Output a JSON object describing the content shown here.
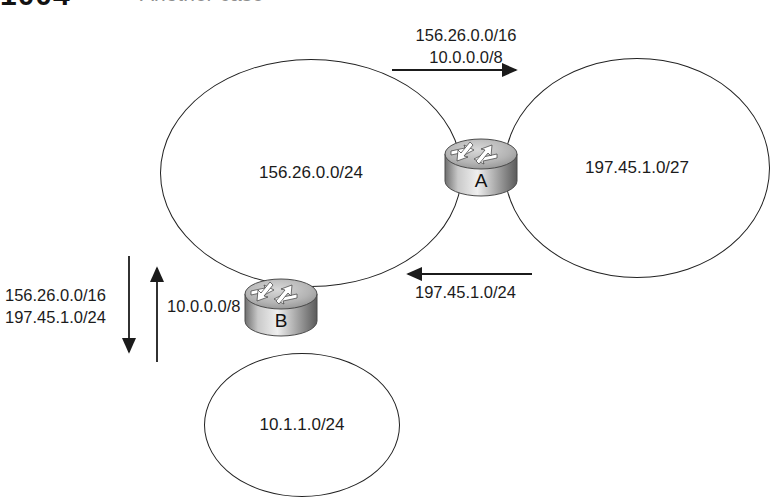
{
  "figure": {
    "number": "1004",
    "caption": "Another case"
  },
  "networks": {
    "left": {
      "label": "156.26.0.0/24"
    },
    "right": {
      "label": "197.45.1.0/27"
    },
    "bottom": {
      "label": "10.1.1.0/24"
    }
  },
  "routers": {
    "a": {
      "letter": "A",
      "icon": "router-icon"
    },
    "b": {
      "letter": "B",
      "icon": "router-icon"
    }
  },
  "advertisements": {
    "top": {
      "routes": "156.26.0.0/16\n10.0.0.0/8",
      "route_1": "156.26.0.0/16",
      "route_2": "10.0.0.0/8",
      "direction": "right"
    },
    "middle": {
      "route_1": "197.45.1.0/24",
      "direction": "left"
    },
    "left_down": {
      "route_1": "156.26.0.0/16",
      "route_2": "197.45.1.0/24",
      "direction": "down"
    },
    "left_up": {
      "route_1": "10.0.0.0/8",
      "direction": "up"
    }
  },
  "colors": {
    "stroke": "#222222",
    "text": "#1b1b1b",
    "router_light": "#e8e8e8",
    "router_mid": "#9a9a9a",
    "router_dark": "#5f5f5f",
    "caption_gray": "#8f8f8f"
  }
}
